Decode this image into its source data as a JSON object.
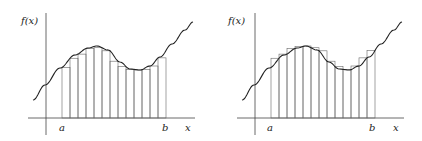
{
  "chart_data": [
    {
      "type": "bar",
      "title": "Lower Riemann sum (left figure)",
      "ylabel": "f(x)",
      "xlabel": "x",
      "interval_labels": [
        "a",
        "b"
      ],
      "num_rectangles": 13,
      "rectangle_rule": "inscribed (minimum of f on each subinterval)"
    },
    {
      "type": "bar",
      "title": "Upper Riemann sum (right figure)",
      "ylabel": "f(x)",
      "xlabel": "x",
      "interval_labels": [
        "a",
        "b"
      ],
      "num_rectangles": 13,
      "rectangle_rule": "circumscribed (maximum of f on each subinterval)"
    }
  ],
  "labels": {
    "fx": "f(x)",
    "a": "a",
    "b": "b",
    "x": "x"
  }
}
